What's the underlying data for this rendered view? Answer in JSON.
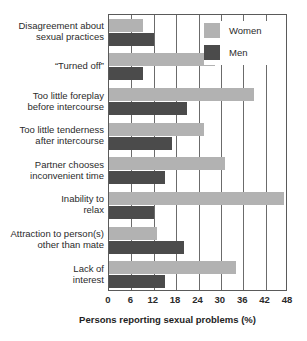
{
  "chart_data": {
    "type": "bar",
    "orientation": "horizontal",
    "title": "",
    "xlabel": "Persons reporting sexual problems (%)",
    "ylabel": "",
    "xlim": [
      0,
      48
    ],
    "xticks": [
      0,
      6,
      12,
      18,
      24,
      30,
      36,
      42,
      48
    ],
    "grid": true,
    "grid_axis": "x",
    "legend_position": "top-right",
    "categories": [
      "Disagreement about\nsexual practices",
      "“Turned off”",
      "Too little foreplay\nbefore intercourse",
      "Too little tenderness\nafter intercourse",
      "Partner chooses\ninconvenient time",
      "Inability to\nrelax",
      "Attraction to person(s)\nother than mate",
      "Lack of\ninterest"
    ],
    "series": [
      {
        "name": "Women",
        "color": "#b2b2b2",
        "values": [
          9,
          28.5,
          39,
          25.5,
          31,
          47,
          13,
          34
        ]
      },
      {
        "name": "Men",
        "color": "#4b4b4b",
        "values": [
          12,
          9,
          21,
          17,
          15,
          12,
          20,
          15
        ]
      }
    ]
  },
  "legend": {
    "items": [
      {
        "label": "Women",
        "color": "#b2b2b2"
      },
      {
        "label": "Men",
        "color": "#4b4b4b"
      }
    ]
  }
}
